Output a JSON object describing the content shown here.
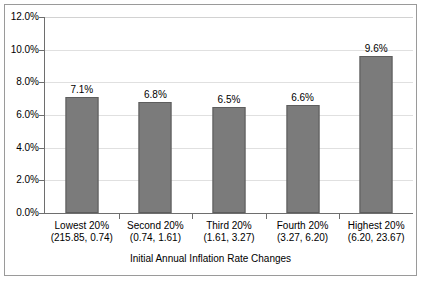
{
  "chart_data": {
    "type": "bar",
    "title": "",
    "xlabel": "Initial Annual Inflation Rate Changes",
    "ylabel": "",
    "ylim": [
      0,
      12
    ],
    "ytick_values": [
      0,
      2,
      4,
      6,
      8,
      10,
      12
    ],
    "ytick_labels": [
      "0.0%",
      "2.0%",
      "4.0%",
      "6.0%",
      "8.0%",
      "10.0%",
      "12.0%"
    ],
    "grid": true,
    "legend": null,
    "bar_color": "#7b7b7b",
    "categories": [
      "Lowest 20%",
      "Second 20%",
      "Third 20%",
      "Fourth 20%",
      "Highest 20%"
    ],
    "category_ranges": [
      "(215.85, 0.74)",
      "(0.74, 1.61)",
      "(1.61, 3.27)",
      "(3.27, 6.20)",
      "(6.20, 23.67)"
    ],
    "values": [
      7.1,
      6.8,
      6.5,
      6.6,
      9.6
    ],
    "data_labels": [
      "7.1%",
      "6.8%",
      "6.5%",
      "6.6%",
      "9.6%"
    ]
  }
}
